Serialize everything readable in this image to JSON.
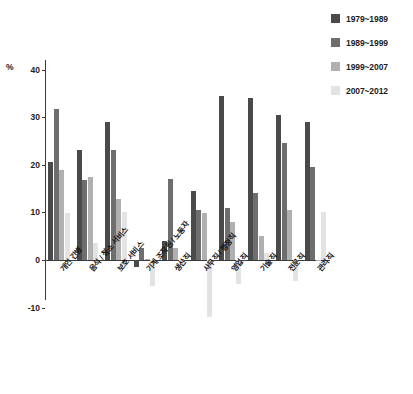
{
  "chart_data": {
    "type": "bar",
    "title": "",
    "xlabel": "",
    "ylabel": "%",
    "ylim": [
      -14,
      42
    ],
    "grid": false,
    "legend_position": "top-right",
    "categories": [
      "개인 간병",
      "음식 / 청소 서비스",
      "보호 서비스",
      "기계 조작원 / 노동자",
      "생산직",
      "사무직 / 행정직",
      "영업직",
      "기술직",
      "전문직",
      "관리직"
    ],
    "series": [
      {
        "name": "1979~1989",
        "color": "#4a4a4a",
        "values": [
          20.5,
          23.0,
          29.0,
          -1.5,
          4.0,
          14.5,
          34.5,
          34.0,
          30.5,
          29.0
        ]
      },
      {
        "name": "1989~1999",
        "color": "#6e6e6e",
        "values": [
          31.8,
          16.8,
          23.0,
          2.5,
          17.0,
          10.5,
          11.0,
          14.0,
          24.5,
          19.5
        ]
      },
      {
        "name": "1999~2007",
        "color": "#b0b0b0",
        "values": [
          18.8,
          17.5,
          12.8,
          0.3,
          2.5,
          9.8,
          8.0,
          5.0,
          10.5,
          0.0
        ]
      },
      {
        "name": "2007~2012",
        "color": "#e3e3e3",
        "values": [
          9.8,
          3.5,
          10.0,
          -5.5,
          -0.8,
          -12.0,
          -5.0,
          1.5,
          -4.5,
          10.0
        ]
      }
    ],
    "y_ticks": [
      40,
      30,
      20,
      10,
      0,
      -10
    ],
    "y_tick_labels": [
      "40",
      "30",
      "20",
      "10",
      "0",
      "-10"
    ],
    "axis_unit_label": "%"
  },
  "legend": {
    "items": [
      {
        "label": "1979~1989",
        "color": "#4a4a4a"
      },
      {
        "label": "1989~1999",
        "color": "#6e6e6e"
      },
      {
        "label": "1999~2007",
        "color": "#b0b0b0"
      },
      {
        "label": "2007~2012",
        "color": "#e3e3e3"
      }
    ]
  }
}
